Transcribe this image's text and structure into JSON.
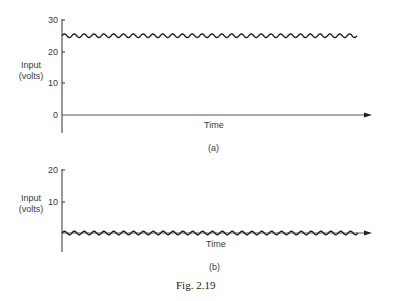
{
  "figure": {
    "caption": "Fig. 2.19"
  },
  "chart_data": [
    {
      "type": "line",
      "panel": "(a)",
      "title": "",
      "xlabel": "Time",
      "ylabel_line1": "Input",
      "ylabel_line2": "(volts)",
      "yticks": [
        "30",
        "20",
        "10",
        "0"
      ],
      "ytick_values": [
        30,
        20,
        10,
        0
      ],
      "ylim": [
        -6,
        30
      ],
      "grid": false,
      "legend": null,
      "series": [
        {
          "name": "input",
          "description": "DC level with small sinusoidal ripple",
          "dc_level": 25,
          "ripple_amplitude": 0.7,
          "cycles": 30
        }
      ]
    },
    {
      "type": "line",
      "panel": "(b)",
      "title": "",
      "xlabel": "Time",
      "ylabel_line1": "Input",
      "ylabel_line2": "(volts)",
      "yticks": [
        "20",
        "10"
      ],
      "ytick_values": [
        20,
        10
      ],
      "ylim": [
        -6,
        20
      ],
      "grid": false,
      "legend": null,
      "series": [
        {
          "name": "input",
          "description": "Small sinusoidal ripple around a near-zero level on the time axis",
          "dc_level": 0,
          "ripple_amplitude": 0.7,
          "cycles": 30
        }
      ]
    }
  ]
}
